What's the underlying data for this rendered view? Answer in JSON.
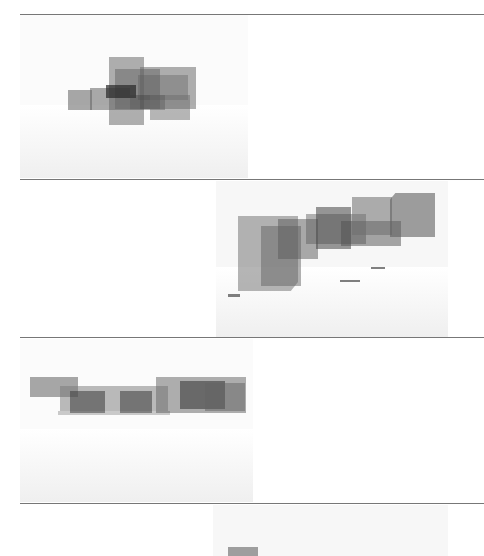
{
  "page": {
    "type": "scanned document page",
    "background_color": "#ffffff",
    "rule_color": "#777777"
  },
  "figures": [
    {
      "id": "figure-1",
      "description": "rendered 3D massing of overlapping translucent grey boxes, view 1",
      "box_color": "#6e6e6e",
      "dark_color": "#333333"
    },
    {
      "id": "figure-2",
      "description": "rendered 3D massing of overlapping translucent grey boxes, perspective view 2",
      "box_color": "#6e6e6e",
      "dark_color": "#333333"
    },
    {
      "id": "figure-3",
      "description": "rendered 3D massing of overlapping translucent grey boxes, elevation view 3",
      "box_color": "#6e6e6e",
      "dark_color": "#333333"
    },
    {
      "id": "figure-4",
      "description": "rendered 3D massing (cut off at page bottom), view 4",
      "box_color": "#6e6e6e",
      "dark_color": "#333333"
    }
  ]
}
